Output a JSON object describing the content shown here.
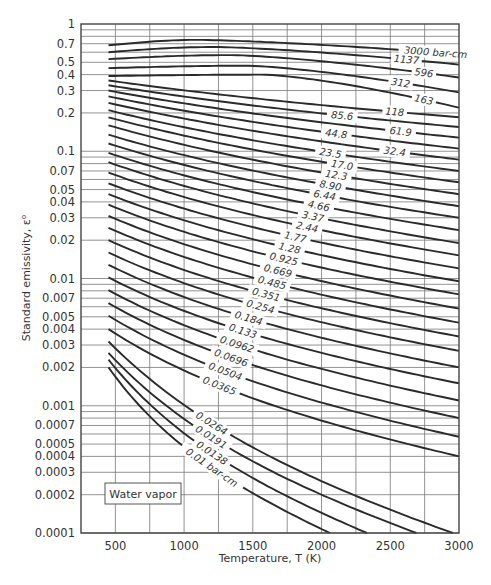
{
  "chart_data": {
    "type": "line",
    "title": "",
    "annotation": "Water vapor",
    "xlabel": "Temperature, T (K)",
    "ylabel": "Standard emissivity, ε⁰",
    "xscale": "linear",
    "yscale": "log",
    "xlim": [
      250,
      3000
    ],
    "ylim": [
      0.0001,
      1
    ],
    "grid": true,
    "x_ticks": [
      500,
      1000,
      1500,
      2000,
      2500,
      3000
    ],
    "x_tick_labels": [
      "500",
      "1000",
      "1500",
      "2000",
      "2500",
      "3000"
    ],
    "y_ticks": [
      1,
      0.7,
      0.5,
      0.4,
      0.3,
      0.2,
      0.1,
      0.07,
      0.05,
      0.04,
      0.03,
      0.02,
      0.01,
      0.007,
      0.005,
      0.004,
      0.003,
      0.002,
      0.001,
      0.0007,
      0.0005,
      0.0004,
      0.0003,
      0.0002,
      0.0001
    ],
    "y_tick_labels": [
      "1",
      "0.7",
      "0.5",
      "0.4",
      "0.3",
      "0.2",
      "0.1",
      "0.07",
      "0.05",
      "0.04",
      "0.03",
      "0.02",
      "0.01",
      "0.007",
      "0.005",
      "0.004",
      "0.003",
      "0.002",
      "0.001",
      "0.0007",
      "0.0005",
      "0.0004",
      "0.0003",
      "0.0002",
      "0.0001"
    ],
    "series_parameter": "pressure path length (bar-cm)",
    "series": [
      {
        "name": "3000 bar-cm",
        "label": "3000 bar-cm",
        "x_start": 450,
        "y_start": 0.68,
        "y_peak": 0.75,
        "x_end": 3000,
        "y_end": 0.58
      },
      {
        "name": "1137",
        "label": "1137",
        "x_start": 450,
        "y_start": 0.6,
        "y_peak": 0.66,
        "x_end": 3000,
        "y_end": 0.48
      },
      {
        "name": "596",
        "label": "596",
        "x_start": 450,
        "y_start": 0.53,
        "y_peak": 0.57,
        "x_end": 3000,
        "y_end": 0.38
      },
      {
        "name": "312",
        "label": "312",
        "x_start": 450,
        "y_start": 0.45,
        "y_peak": 0.47,
        "x_end": 3000,
        "y_end": 0.29
      },
      {
        "name": "163",
        "label": "163",
        "x_start": 450,
        "y_start": 0.39,
        "y_peak": 0.4,
        "x_end": 3000,
        "y_end": 0.22
      },
      {
        "name": "118",
        "label": "118",
        "x_start": 450,
        "y_start": 0.36,
        "x_end": 3000,
        "y_end": 0.185
      },
      {
        "name": "85.6",
        "label": "85.6",
        "x_start": 450,
        "y_start": 0.33,
        "x_end": 3000,
        "y_end": 0.155
      },
      {
        "name": "61.9",
        "label": "61.9",
        "x_start": 450,
        "y_start": 0.3,
        "x_end": 3000,
        "y_end": 0.128
      },
      {
        "name": "44.8",
        "label": "44.8",
        "x_start": 450,
        "y_start": 0.27,
        "x_end": 3000,
        "y_end": 0.105
      },
      {
        "name": "32.4",
        "label": "32.4",
        "x_start": 450,
        "y_start": 0.24,
        "x_end": 3000,
        "y_end": 0.086
      },
      {
        "name": "23.5",
        "label": "23.5",
        "x_start": 450,
        "y_start": 0.21,
        "x_end": 3000,
        "y_end": 0.07
      },
      {
        "name": "17.0",
        "label": "17.0",
        "x_start": 450,
        "y_start": 0.185,
        "x_end": 3000,
        "y_end": 0.057
      },
      {
        "name": "12.3",
        "label": "12.3",
        "x_start": 450,
        "y_start": 0.16,
        "x_end": 3000,
        "y_end": 0.046
      },
      {
        "name": "8.90",
        "label": "8.90",
        "x_start": 450,
        "y_start": 0.135,
        "x_end": 3000,
        "y_end": 0.037
      },
      {
        "name": "6.44",
        "label": "6.44",
        "x_start": 450,
        "y_start": 0.115,
        "x_end": 3000,
        "y_end": 0.03
      },
      {
        "name": "4.66",
        "label": "4.66",
        "x_start": 450,
        "y_start": 0.097,
        "x_end": 3000,
        "y_end": 0.024
      },
      {
        "name": "3.37",
        "label": "3.37",
        "x_start": 450,
        "y_start": 0.082,
        "x_end": 3000,
        "y_end": 0.019
      },
      {
        "name": "2.44",
        "label": "2.44",
        "x_start": 450,
        "y_start": 0.068,
        "x_end": 3000,
        "y_end": 0.0152
      },
      {
        "name": "1.77",
        "label": "1.77",
        "x_start": 450,
        "y_start": 0.056,
        "x_end": 3000,
        "y_end": 0.012
      },
      {
        "name": "1.28",
        "label": "1.28",
        "x_start": 450,
        "y_start": 0.046,
        "x_end": 3000,
        "y_end": 0.0095
      },
      {
        "name": "0.925",
        "label": "0.925",
        "x_start": 450,
        "y_start": 0.038,
        "x_end": 3000,
        "y_end": 0.0075
      },
      {
        "name": "0.669",
        "label": "0.669",
        "x_start": 450,
        "y_start": 0.031,
        "x_end": 3000,
        "y_end": 0.0058
      },
      {
        "name": "0.485",
        "label": "0.485",
        "x_start": 450,
        "y_start": 0.025,
        "x_end": 3000,
        "y_end": 0.0045
      },
      {
        "name": "0.351",
        "label": "0.351",
        "x_start": 450,
        "y_start": 0.02,
        "x_end": 3000,
        "y_end": 0.0035
      },
      {
        "name": "0.254",
        "label": "0.254",
        "x_start": 450,
        "y_start": 0.016,
        "x_end": 3000,
        "y_end": 0.0027
      },
      {
        "name": "0.184",
        "label": "0.184",
        "x_start": 450,
        "y_start": 0.0128,
        "x_end": 3000,
        "y_end": 0.002
      },
      {
        "name": "0.133",
        "label": "0.133",
        "x_start": 450,
        "y_start": 0.0102,
        "x_end": 3000,
        "y_end": 0.0015
      },
      {
        "name": "0.0962",
        "label": "0.0962",
        "x_start": 450,
        "y_start": 0.0081,
        "x_end": 3000,
        "y_end": 0.0011
      },
      {
        "name": "0.0696",
        "label": "0.0696",
        "x_start": 450,
        "y_start": 0.0064,
        "x_end": 3000,
        "y_end": 0.0008
      },
      {
        "name": "0.0504",
        "label": "0.0504",
        "x_start": 450,
        "y_start": 0.0051,
        "x_end": 3000,
        "y_end": 0.00057
      },
      {
        "name": "0.0365",
        "label": "0.0365",
        "x_start": 450,
        "y_start": 0.004,
        "x_end": 3000,
        "y_end": 0.0004
      },
      {
        "name": "0.0264",
        "label": "0.0264",
        "x_start": 450,
        "y_start": 0.0032,
        "x_end": 2955,
        "y_end": 0.0001
      },
      {
        "name": "0.0191",
        "label": "0.0191",
        "x_start": 450,
        "y_start": 0.0026,
        "x_end": 2690,
        "y_end": 0.0001
      },
      {
        "name": "0.0138",
        "label": "0.0138",
        "x_start": 450,
        "y_start": 0.0023,
        "x_end": 2330,
        "y_end": 0.0001
      },
      {
        "name": "0.01 bar-cm",
        "label": "0.01 bar-cm",
        "x_start": 450,
        "y_start": 0.002,
        "x_end": 2060,
        "y_end": 0.0001
      }
    ]
  }
}
